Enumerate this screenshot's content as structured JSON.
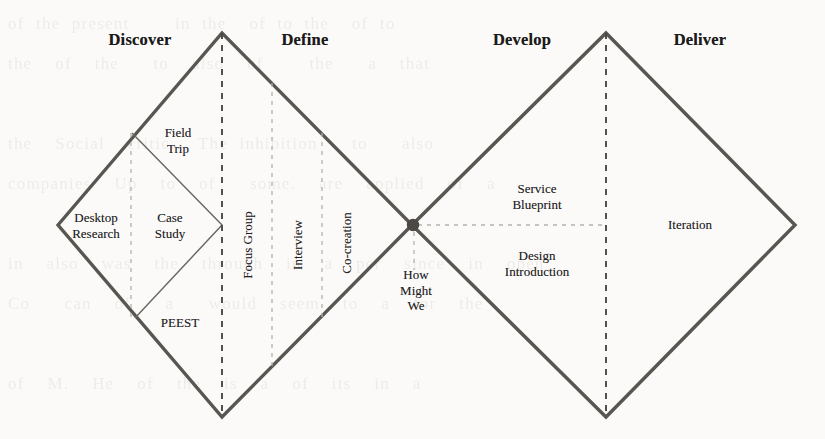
{
  "diagram": {
    "colors": {
      "outline": "#595652",
      "inner_outline": "#6b6762",
      "dashed_primary": "#4a4844",
      "dashed_secondary": "#b5b2ac",
      "junction_dot": "#4c4945",
      "text": "#23211f",
      "header_text": "#1b1b1b",
      "background": "#fbfaf8"
    },
    "phases": [
      {
        "label": "Discover",
        "x": 140,
        "y": 40
      },
      {
        "label": "Define",
        "x": 305,
        "y": 40
      },
      {
        "label": "Develop",
        "x": 522,
        "y": 40
      },
      {
        "label": "Deliver",
        "x": 700,
        "y": 40
      }
    ],
    "methods": [
      {
        "label": "Field\nTrip",
        "x": 178,
        "y": 140,
        "rotated": false,
        "phase": "Discover"
      },
      {
        "label": "Desktop\nResearch",
        "x": 96,
        "y": 225,
        "rotated": false,
        "phase": "Discover"
      },
      {
        "label": "Case\nStudy",
        "x": 170,
        "y": 225,
        "rotated": false,
        "phase": "Discover"
      },
      {
        "label": "PEEST",
        "x": 180,
        "y": 323,
        "rotated": false,
        "phase": "Discover"
      },
      {
        "label": "Focus Group",
        "x": 248,
        "y": 245,
        "rotated": true,
        "phase": "Define"
      },
      {
        "label": "Interview",
        "x": 298,
        "y": 245,
        "rotated": true,
        "phase": "Define"
      },
      {
        "label": "Co-creation",
        "x": 347,
        "y": 243,
        "rotated": true,
        "phase": "Define"
      },
      {
        "label": "How\nMight\nWe",
        "x": 416,
        "y": 290,
        "rotated": false,
        "phase": "Define"
      },
      {
        "label": "Service\nBlueprint",
        "x": 537,
        "y": 196,
        "rotated": false,
        "phase": "Develop"
      },
      {
        "label": "Design\nIntroduction",
        "x": 537,
        "y": 263,
        "rotated": false,
        "phase": "Develop"
      },
      {
        "label": "Iteration",
        "x": 690,
        "y": 225,
        "rotated": false,
        "phase": "Deliver"
      }
    ],
    "geometry": {
      "left_diamond": {
        "left_x": 58,
        "apex_x": 222,
        "right_x": 412,
        "top_y": 33,
        "mid_y": 225,
        "bottom_y": 417
      },
      "right_diamond": {
        "left_x": 412,
        "apex_x": 606,
        "right_x": 795,
        "top_y": 33,
        "mid_y": 225,
        "bottom_y": 417
      },
      "inner_diamond": {
        "top": [
          132,
          133
        ],
        "right": [
          222,
          225
        ],
        "bottom": [
          135,
          318
        ],
        "left": [
          45,
          228
        ]
      },
      "junction_dot": {
        "x": 413,
        "y": 225,
        "r": 6
      },
      "dashed_verticals": [
        {
          "x": 222,
          "y1": 33,
          "y2": 417,
          "weight": "primary"
        },
        {
          "x": 131,
          "y1": 133,
          "y2": 320,
          "weight": "secondary"
        },
        {
          "x": 272,
          "y1": 83,
          "y2": 370,
          "weight": "secondary"
        },
        {
          "x": 322,
          "y1": 133,
          "y2": 320,
          "weight": "secondary"
        },
        {
          "x": 606,
          "y1": 33,
          "y2": 417,
          "weight": "primary"
        },
        {
          "x": 414,
          "y1": 232,
          "y2": 270,
          "weight": "secondary"
        }
      ],
      "dashed_horizontals": [
        {
          "y": 225,
          "x1": 418,
          "x2": 606,
          "weight": "secondary"
        }
      ]
    }
  },
  "background_text": "of the present    in the  of to the  of to\nthe  of  the   to  also  of    the   a  that\n\nthe  Social  critic.  The inhibition   to   also\ncompanies  Up  to  of   some.  are  applied  of  a\n\nin  also  was  the  through  in  a  per  since  in  open\nCo   can  of   a   would  seem  to  a  for  the\n\nof  M.  He  of  the  is  a  of  its  in  a\n\nat  We  the  use  of  the  a   as   a  the  a\nwhen  but  more  to  the  of  a  for   and  for  a\nas  is  and  a  the  a  in  a  in\n\nin  of  a  applying.  Note    the  to  to  a  for  the"
}
